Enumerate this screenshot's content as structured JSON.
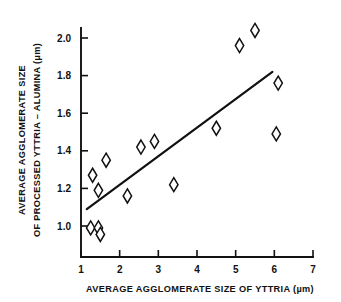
{
  "chart_data": {
    "type": "scatter",
    "title": "",
    "xlabel": "AVERAGE AGGLOMERATE SIZE OF YTTRIA (µm)",
    "ylabel_line1": "AVERAGE AGGLOMERATE SIZE",
    "ylabel_line2": "OF PROCESSED YTTRIA – ALUMINA (µm)",
    "xlim": [
      1,
      7
    ],
    "ylim": [
      0.93,
      2.12
    ],
    "grid": false,
    "legend": "none",
    "marker_style": "open-diamond",
    "xticks": [
      1,
      2,
      3,
      4,
      5,
      6,
      7
    ],
    "xtick_labels": [
      "1",
      "2",
      "3",
      "4",
      "5",
      "6",
      "7"
    ],
    "yticks": [
      1.0,
      1.2,
      1.4,
      1.6,
      1.8,
      2.0
    ],
    "ytick_labels": [
      "1.0",
      "1.2",
      "1.4",
      "1.6",
      "1.8",
      "2.0"
    ],
    "series": [
      {
        "name": "agglomerate size measurements",
        "marker": "open-diamond",
        "points": [
          {
            "x": 1.25,
            "y": 0.99
          },
          {
            "x": 1.45,
            "y": 0.99
          },
          {
            "x": 1.5,
            "y": 0.955
          },
          {
            "x": 1.3,
            "y": 1.27
          },
          {
            "x": 1.45,
            "y": 1.19
          },
          {
            "x": 1.65,
            "y": 1.35
          },
          {
            "x": 2.2,
            "y": 1.16
          },
          {
            "x": 2.55,
            "y": 1.42
          },
          {
            "x": 2.9,
            "y": 1.45
          },
          {
            "x": 3.4,
            "y": 1.22
          },
          {
            "x": 4.5,
            "y": 1.52
          },
          {
            "x": 5.1,
            "y": 1.96
          },
          {
            "x": 5.5,
            "y": 2.04
          },
          {
            "x": 6.05,
            "y": 1.49
          },
          {
            "x": 6.1,
            "y": 1.76
          }
        ]
      }
    ],
    "trend_line": {
      "name": "linear fit",
      "x0": 1.15,
      "y0": 1.09,
      "x1": 5.95,
      "y1": 1.82
    }
  }
}
